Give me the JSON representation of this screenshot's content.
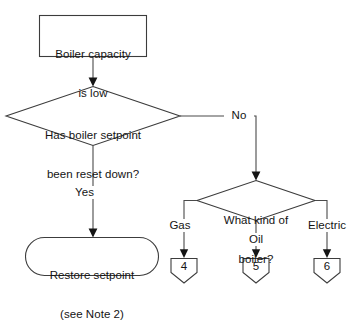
{
  "diagram": {
    "background_color": "#ffffff",
    "line_color": "#3c3c3c",
    "text_color": "#141414",
    "nodes": {
      "start": {
        "shape": "rectangle",
        "line1": "Boiler capacity",
        "line2": "is low"
      },
      "decision_setpoint": {
        "shape": "diamond",
        "line1": "Has boiler setpoint",
        "line2": "been reset down?"
      },
      "decision_boiler_kind": {
        "shape": "diamond",
        "line1": "What kind of",
        "line2": "boiler?"
      },
      "action_restore": {
        "shape": "rounded-rectangle",
        "line1": "Restore setpoint",
        "line2": "(see Note 2)"
      }
    },
    "edge_labels": {
      "yes": "Yes",
      "no": "No",
      "gas": "Gas",
      "oil": "Oil",
      "electric": "Electric"
    },
    "connectors": [
      {
        "label": "4",
        "branch": "Gas"
      },
      {
        "label": "5",
        "branch": "Oil"
      },
      {
        "label": "6",
        "branch": "Electric"
      }
    ]
  }
}
